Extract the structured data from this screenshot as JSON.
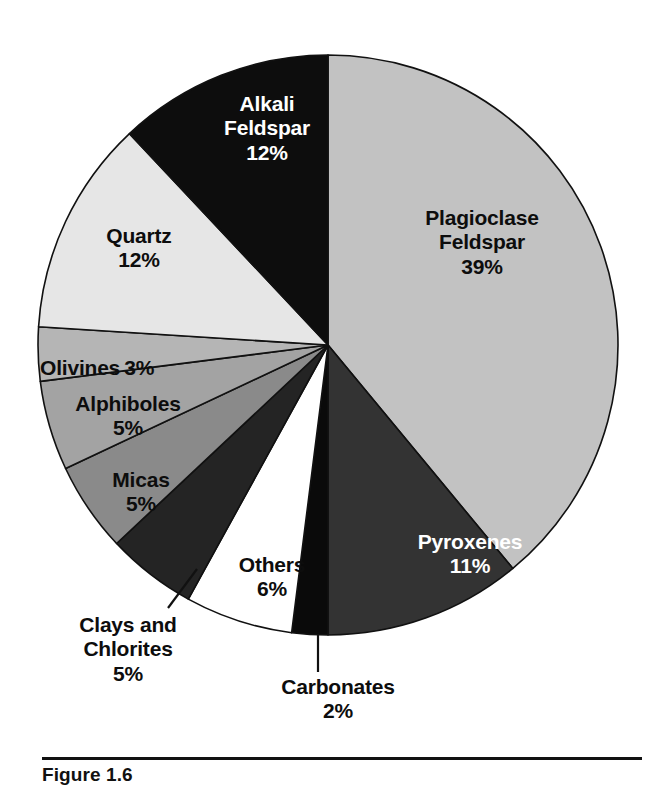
{
  "figure": {
    "caption": "Figure 1.6",
    "rule_color": "#111111"
  },
  "chart_data": {
    "type": "pie",
    "title": "",
    "subtitle": "",
    "xlabel": "",
    "ylabel": "",
    "units": "percent",
    "total": 100,
    "start_angle_deg": 0,
    "direction": "clockwise",
    "legend": "none",
    "grid": false,
    "labels_placement": "in-slice with leader lines for small slices",
    "categories": [
      "Plagioclase Feldspar",
      "Pyroxenes",
      "Carbonates",
      "Others",
      "Clays and Chlorites",
      "Micas",
      "Alphiboles",
      "Olivines",
      "Quartz",
      "Alkali Feldspar"
    ],
    "values": [
      39,
      11,
      2,
      6,
      5,
      5,
      5,
      3,
      12,
      12
    ],
    "slices": [
      {
        "key": "plagioclase",
        "name_lines": [
          "Plagioclase",
          "Feldspar"
        ],
        "name": "Plagioclase Feldspar",
        "value": 39,
        "pct_label": "39%",
        "color": "#c2c2c2",
        "text_color": "#0d0d0d",
        "start_deg": 0,
        "sweep_deg": 140.4
      },
      {
        "key": "pyroxenes",
        "name_lines": [
          "Pyroxenes"
        ],
        "name": "Pyroxenes",
        "value": 11,
        "pct_label": "11%",
        "color": "#333333",
        "text_color": "#ffffff",
        "start_deg": 140.4,
        "sweep_deg": 39.6
      },
      {
        "key": "carbonates",
        "name_lines": [
          "Carbonates"
        ],
        "name": "Carbonates",
        "value": 2,
        "pct_label": "2%",
        "color": "#0a0a0a",
        "text_color": "#0d0d0d",
        "start_deg": 180.0,
        "sweep_deg": 7.2
      },
      {
        "key": "others",
        "name_lines": [
          "Others"
        ],
        "name": "Others",
        "value": 6,
        "pct_label": "6%",
        "color": "#ffffff",
        "text_color": "#0d0d0d",
        "start_deg": 187.2,
        "sweep_deg": 21.6
      },
      {
        "key": "clays",
        "name_lines": [
          "Clays and",
          "Chlorites"
        ],
        "name": "Clays and Chlorites",
        "value": 5,
        "pct_label": "5%",
        "color": "#242424",
        "text_color": "#0d0d0d",
        "start_deg": 208.8,
        "sweep_deg": 18.0
      },
      {
        "key": "micas",
        "name_lines": [
          "Micas"
        ],
        "name": "Micas",
        "value": 5,
        "pct_label": "5%",
        "color": "#8a8a8a",
        "text_color": "#0d0d0d",
        "start_deg": 226.8,
        "sweep_deg": 18.0
      },
      {
        "key": "alphiboles",
        "name_lines": [
          "Alphiboles"
        ],
        "name": "Alphiboles",
        "value": 5,
        "pct_label": "5%",
        "color": "#a3a3a3",
        "text_color": "#0d0d0d",
        "start_deg": 244.8,
        "sweep_deg": 18.0
      },
      {
        "key": "olivines",
        "name_lines": [
          "Olivines"
        ],
        "name": "Olivines",
        "value": 3,
        "pct_label": "3%",
        "color": "#b5b5b5",
        "text_color": "#0d0d0d",
        "start_deg": 262.8,
        "sweep_deg": 10.8
      },
      {
        "key": "quartz",
        "name_lines": [
          "Quartz"
        ],
        "name": "Quartz",
        "value": 12,
        "pct_label": "12%",
        "color": "#e6e6e6",
        "text_color": "#0d0d0d",
        "start_deg": 273.6,
        "sweep_deg": 43.2
      },
      {
        "key": "alkali",
        "name_lines": [
          "Alkali",
          "Feldspar"
        ],
        "name": "Alkali Feldspar",
        "value": 12,
        "pct_label": "12%",
        "color": "#0d0d0d",
        "text_color": "#ffffff",
        "start_deg": 316.8,
        "sweep_deg": 43.2
      }
    ],
    "geometry": {
      "center_x": 328,
      "center_y": 345,
      "radius": 290,
      "stroke_color": "#111111",
      "stroke_width": 1.6
    },
    "leader_lines": [
      {
        "name": "clays-leader",
        "x1": 168,
        "y1": 608,
        "x2": 197,
        "y2": 569
      },
      {
        "name": "carbonates-leader",
        "x1": 318,
        "y1": 672,
        "x2": 318,
        "y2": 634
      }
    ]
  }
}
